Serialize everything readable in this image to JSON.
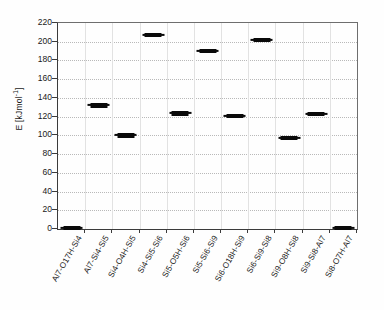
{
  "chart_data": {
    "type": "scatter",
    "title": "",
    "xlabel": "",
    "ylabel": "E [kJmol-1]",
    "ylabel_base": "E [kJmol",
    "ylabel_exponent": "-1",
    "ylabel_tail": "]",
    "ylim": [
      0,
      220
    ],
    "ytick_step": 20,
    "yticks": [
      "0",
      "20",
      "40",
      "60",
      "80",
      "100",
      "120",
      "140",
      "160",
      "180",
      "200",
      "220"
    ],
    "ytick_values": [
      0,
      20,
      40,
      60,
      80,
      100,
      120,
      140,
      160,
      180,
      200,
      220
    ],
    "grid": true,
    "grid_axis": "y",
    "legend": "none",
    "marker_style": "horizontal-dash",
    "marker_color": "#0a0a0a",
    "categories": [
      "Al7-O17H-Si4",
      "Al7-Si4-Si5",
      "Si4-O4H-Si5",
      "Si4-Si5-Si6",
      "Si5-O5H-Si6",
      "Si5-Si6-Si9",
      "Si6-O18H-Si9",
      "Si6-Si9-Si8",
      "Si9-O8H-Si8",
      "Si9-Si8-Al7",
      "Si8-O7H-Al7"
    ],
    "values": [
      1,
      132,
      100,
      207,
      123.5,
      190,
      120.5,
      202,
      97,
      122.5,
      1
    ]
  }
}
